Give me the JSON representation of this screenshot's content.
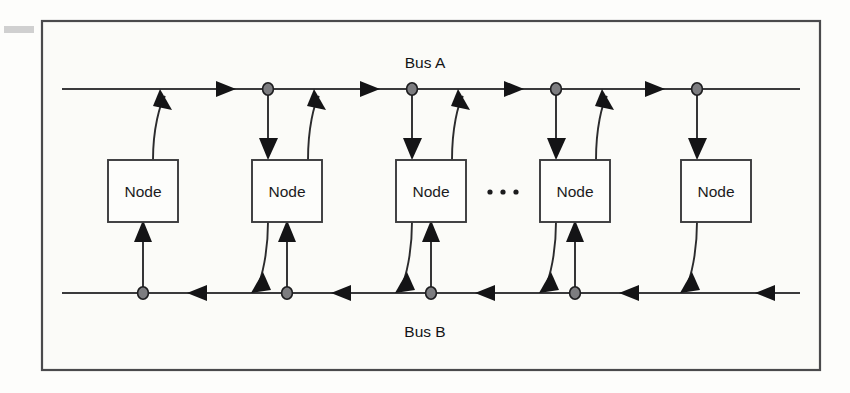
{
  "figure": {
    "frame": {
      "x": 42,
      "y": 21,
      "width": 778,
      "height": 349,
      "border_color": "#4a4a4c",
      "background_color": "#fbfbf8"
    },
    "buses": [
      {
        "id": "bus-a",
        "label": "Bus A",
        "label_x": 425,
        "label_y": 68,
        "line_y": 89,
        "x_start": 62,
        "x_end": 800,
        "direction": "left-to-right",
        "color": "#3a3a3c"
      },
      {
        "id": "bus-b",
        "label": "Bus B",
        "label_x": 425,
        "label_y": 337,
        "line_y": 293,
        "x_start": 62,
        "x_end": 800,
        "direction": "right-to-left",
        "color": "#3a3a3c"
      }
    ],
    "node_label": "Node",
    "nodes": [
      {
        "id": "node-1",
        "label": "Node",
        "x": 108,
        "y": 160,
        "width": 70,
        "height": 62,
        "writes_to_bus_a": true,
        "reads_from_bus_a": false,
        "reads_from_bus_b": true,
        "writes_to_bus_b": false
      },
      {
        "id": "node-2",
        "label": "Node",
        "x": 252,
        "y": 160,
        "width": 70,
        "height": 62,
        "writes_to_bus_a": true,
        "reads_from_bus_a": true,
        "reads_from_bus_b": true,
        "writes_to_bus_b": true
      },
      {
        "id": "node-3",
        "label": "Node",
        "x": 396,
        "y": 160,
        "width": 70,
        "height": 62,
        "writes_to_bus_a": true,
        "reads_from_bus_a": true,
        "reads_from_bus_b": true,
        "writes_to_bus_b": true
      },
      {
        "id": "node-4",
        "label": "Node",
        "x": 540,
        "y": 160,
        "width": 70,
        "height": 62,
        "writes_to_bus_a": true,
        "reads_from_bus_a": true,
        "reads_from_bus_b": true,
        "writes_to_bus_b": true
      },
      {
        "id": "node-5",
        "label": "Node",
        "x": 681,
        "y": 160,
        "width": 70,
        "height": 62,
        "writes_to_bus_a": false,
        "reads_from_bus_a": true,
        "reads_from_bus_b": false,
        "writes_to_bus_b": true
      }
    ],
    "ellipsis": {
      "text": "...",
      "x": 503,
      "y": 192,
      "dot_count": 3
    },
    "bus_a_taps": [
      {
        "x": 268,
        "y": 89
      },
      {
        "x": 412,
        "y": 89
      },
      {
        "x": 556,
        "y": 89
      },
      {
        "x": 697,
        "y": 89
      }
    ],
    "bus_b_taps": [
      {
        "x": 128,
        "y": 293
      },
      {
        "x": 272,
        "y": 293
      },
      {
        "x": 416,
        "y": 293
      },
      {
        "x": 560,
        "y": 293
      }
    ],
    "bus_a_flow_arrows": [
      {
        "x": 228,
        "y": 89
      },
      {
        "x": 372,
        "y": 89
      },
      {
        "x": 516,
        "y": 89
      },
      {
        "x": 657,
        "y": 89
      }
    ],
    "bus_b_flow_arrows": [
      {
        "x": 195,
        "y": 293
      },
      {
        "x": 339,
        "y": 293
      },
      {
        "x": 483,
        "y": 293
      },
      {
        "x": 627,
        "y": 293
      }
    ],
    "dot_color": "#7d7d80",
    "arrow_color": "#141416"
  }
}
